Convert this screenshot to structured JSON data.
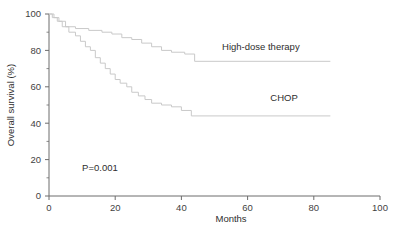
{
  "chart_data": {
    "type": "line",
    "subtype": "kaplan-meier-step",
    "title": "",
    "xlabel": "Months",
    "ylabel": "Overall survival (%)",
    "xlim": [
      0,
      100
    ],
    "ylim": [
      0,
      100
    ],
    "xticks": [
      0,
      20,
      40,
      60,
      80,
      100
    ],
    "xticklabels": [
      "0",
      "20",
      "40",
      "60",
      "80",
      "100"
    ],
    "yticks": [
      0,
      20,
      40,
      60,
      80,
      100
    ],
    "yticklabels": [
      "0",
      "20",
      "40",
      "60",
      "80",
      "100"
    ],
    "y_minor_ticks": [
      10,
      30,
      50,
      70,
      90
    ],
    "grid": false,
    "legend_position": "inline-right",
    "annotations": [
      {
        "name": "p-value",
        "text": "P=0.001",
        "x": 10,
        "y": 14
      }
    ],
    "series": [
      {
        "name": "High-dose therapy",
        "color": "#c9c9c9",
        "label_x": 64,
        "label_y": 80,
        "end_x": 85,
        "points": [
          [
            0,
            100
          ],
          [
            1.5,
            100
          ],
          [
            1.5,
            98
          ],
          [
            3,
            98
          ],
          [
            3,
            96
          ],
          [
            5,
            96
          ],
          [
            5,
            93
          ],
          [
            8,
            93
          ],
          [
            8,
            92
          ],
          [
            12,
            92
          ],
          [
            12,
            91
          ],
          [
            16,
            91
          ],
          [
            16,
            90
          ],
          [
            19,
            90
          ],
          [
            19,
            89
          ],
          [
            22,
            89
          ],
          [
            22,
            87
          ],
          [
            25,
            87
          ],
          [
            25,
            86
          ],
          [
            28,
            86
          ],
          [
            28,
            84
          ],
          [
            31,
            84
          ],
          [
            31,
            82
          ],
          [
            34,
            82
          ],
          [
            34,
            80
          ],
          [
            37,
            80
          ],
          [
            37,
            79
          ],
          [
            41,
            79
          ],
          [
            41,
            78
          ],
          [
            44,
            78
          ],
          [
            44,
            74
          ],
          [
            85,
            74
          ]
        ]
      },
      {
        "name": "CHOP",
        "color": "#c9c9c9",
        "label_x": 71,
        "label_y": 52,
        "end_x": 85,
        "points": [
          [
            0,
            100
          ],
          [
            1,
            100
          ],
          [
            1,
            98
          ],
          [
            2.5,
            98
          ],
          [
            2.5,
            96
          ],
          [
            4,
            96
          ],
          [
            4,
            93
          ],
          [
            6,
            93
          ],
          [
            6,
            90
          ],
          [
            8,
            90
          ],
          [
            8,
            88
          ],
          [
            9.5,
            88
          ],
          [
            9.5,
            85
          ],
          [
            11,
            85
          ],
          [
            11,
            82
          ],
          [
            12.5,
            82
          ],
          [
            12.5,
            80
          ],
          [
            14,
            80
          ],
          [
            14,
            76
          ],
          [
            15.5,
            76
          ],
          [
            15.5,
            73
          ],
          [
            17,
            73
          ],
          [
            17,
            70
          ],
          [
            18.5,
            70
          ],
          [
            18.5,
            67
          ],
          [
            20,
            67
          ],
          [
            20,
            64
          ],
          [
            21.5,
            64
          ],
          [
            21.5,
            62
          ],
          [
            23.5,
            62
          ],
          [
            23.5,
            60
          ],
          [
            25,
            60
          ],
          [
            25,
            57
          ],
          [
            27,
            57
          ],
          [
            27,
            55
          ],
          [
            29,
            55
          ],
          [
            29,
            53
          ],
          [
            31,
            53
          ],
          [
            31,
            51
          ],
          [
            34,
            51
          ],
          [
            34,
            50
          ],
          [
            37,
            50
          ],
          [
            37,
            49
          ],
          [
            40,
            49
          ],
          [
            40,
            47
          ],
          [
            43,
            47
          ],
          [
            43,
            44
          ],
          [
            85,
            44
          ]
        ]
      }
    ]
  }
}
